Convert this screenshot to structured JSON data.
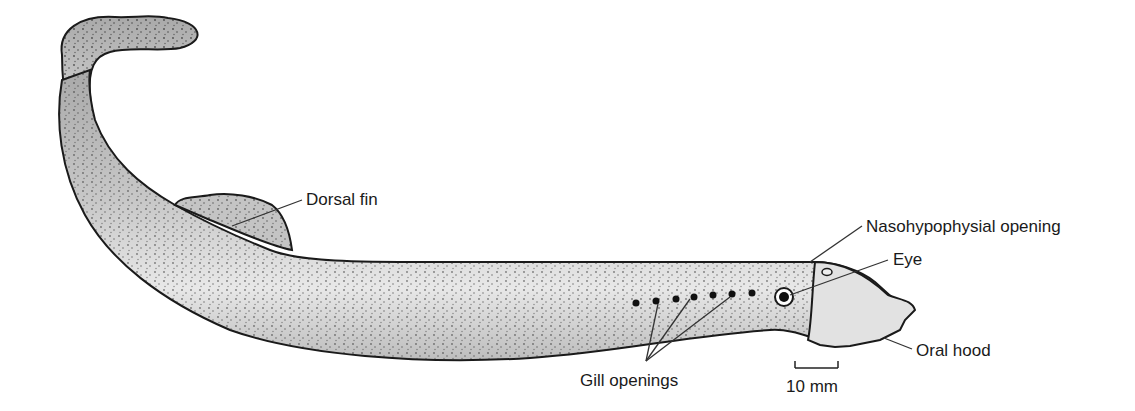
{
  "figure": {
    "labels": {
      "dorsal_fin": "Dorsal fin",
      "nasohypophysial_opening": "Nasohypophysial opening",
      "eye": "Eye",
      "oral_hood": "Oral hood",
      "gill_openings": "Gill openings",
      "scale_bar": "10 mm"
    },
    "colors": {
      "body_fill": "#c9c9c9",
      "belly_fill": "#e6e6e6",
      "outline": "#1a1a1a",
      "leader_line": "#333333"
    }
  }
}
